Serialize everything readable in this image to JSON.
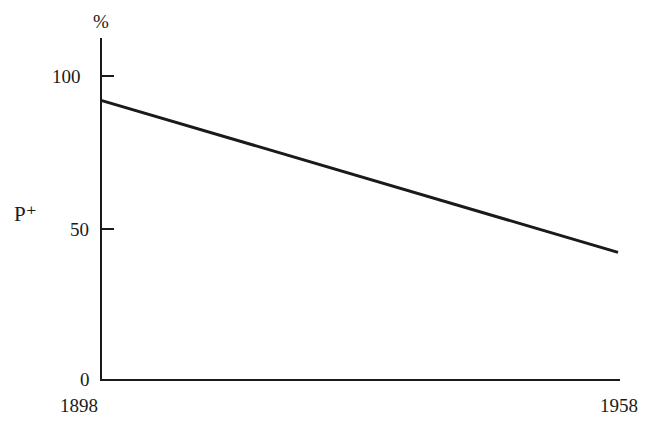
{
  "chart_data": {
    "type": "line",
    "title": "",
    "xlabel": "",
    "ylabel": "P⁺",
    "yunit": "%",
    "x": [
      1898,
      1958
    ],
    "series": [
      {
        "name": "P⁺",
        "values": [
          92,
          42
        ]
      }
    ],
    "xlim": [
      1898,
      1958
    ],
    "ylim": [
      0,
      100
    ],
    "xticks": [
      "1898",
      "1958"
    ],
    "yticks": [
      "0",
      "50",
      "100"
    ],
    "grid": false,
    "legend": null
  },
  "labels": {
    "unit": "%",
    "ylabel": "P⁺",
    "y100": "100",
    "y50": "50",
    "y0": "0",
    "x_start": "1898",
    "x_end": "1958"
  }
}
